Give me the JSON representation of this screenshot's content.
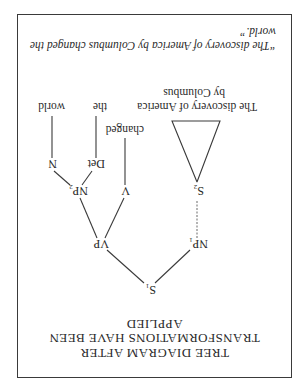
{
  "figure": {
    "orientation": "rotated 180 degrees",
    "title_lines": [
      "TREE DIAGRAM AFTER",
      "TRANSFORMATIONS HAVE BEEN",
      "APPLIED"
    ],
    "nodes": {
      "s1": {
        "label": "S",
        "sub": "1"
      },
      "np1": {
        "label": "NP",
        "sub": "1"
      },
      "vp": {
        "label": "VP",
        "sub": ""
      },
      "s2": {
        "label": "S",
        "sub": "2"
      },
      "v": {
        "label": "V",
        "sub": ""
      },
      "np2": {
        "label": "NP",
        "sub": "2"
      },
      "det": {
        "label": "Det",
        "sub": ""
      },
      "n": {
        "label": "N",
        "sub": ""
      }
    },
    "leaves": {
      "subject_line1": "The discovery of America",
      "subject_line2": "by Columbus",
      "verb": "changed",
      "det": "the",
      "noun": "world"
    },
    "caption": "“The discovery of America by Columbus changed the world.”"
  }
}
